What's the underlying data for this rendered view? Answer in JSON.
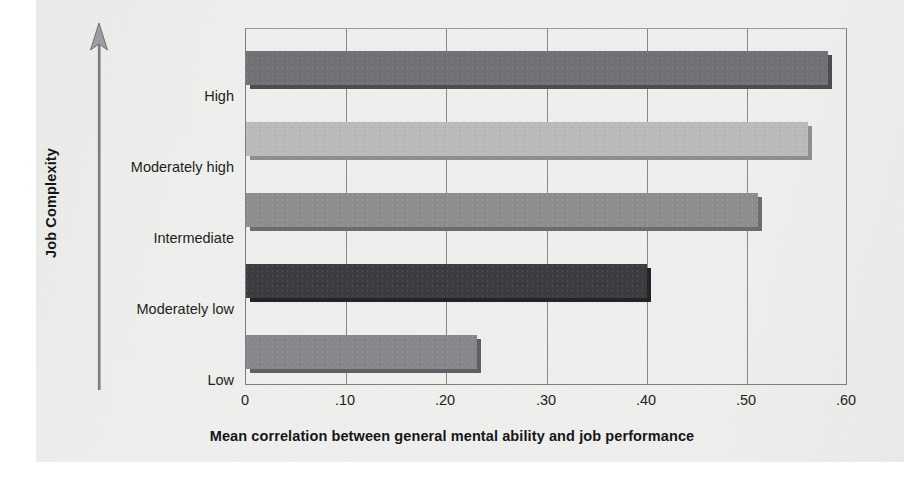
{
  "chart_data": {
    "type": "bar",
    "orientation": "horizontal",
    "title": "",
    "xlabel": "Mean correlation between general mental ability and job performance",
    "ylabel": "Job Complexity",
    "categories": [
      "High",
      "Moderately high",
      "Intermediate",
      "Moderately low",
      "Low"
    ],
    "values": [
      0.58,
      0.56,
      0.51,
      0.4,
      0.23
    ],
    "xlim": [
      0,
      0.6
    ],
    "xticks": [
      0,
      0.1,
      0.2,
      0.3,
      0.4,
      0.5,
      0.6
    ],
    "xticklabels": [
      "0",
      ".10",
      ".20",
      ".30",
      ".40",
      ".50",
      ".60"
    ],
    "grid": "vertical",
    "legend": "none",
    "bar_colors": [
      "#6f7174",
      "#b9babb",
      "#8b8d8f",
      "#3a3c3f",
      "#85878a"
    ],
    "bar_shadow_colors": [
      "#4a4c4f",
      "#8d8e90",
      "#6a6c6e",
      "#232427",
      "#5e6063"
    ],
    "axis_direction_note": "upward arrow indicating increasing job complexity"
  },
  "axis": {
    "y_title": "Job Complexity",
    "x_title": "Mean correlation between general mental ability and job performance"
  },
  "categories": [
    {
      "label": "High",
      "value": 0.58
    },
    {
      "label": "Moderately high",
      "value": 0.56
    },
    {
      "label": "Intermediate",
      "value": 0.51
    },
    {
      "label": "Moderately low",
      "value": 0.4
    },
    {
      "label": "Low",
      "value": 0.23
    }
  ],
  "xticklabels": [
    "0",
    ".10",
    ".20",
    ".30",
    ".40",
    ".50",
    ".60"
  ],
  "colors": {
    "paper": "#eeeeec",
    "axis_line": "#7b7d80",
    "gridline": "#86888b",
    "text": "#1d1f22"
  }
}
